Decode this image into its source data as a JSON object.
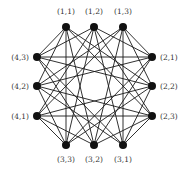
{
  "diagram": {
    "title": "",
    "type": "graph",
    "colors": {
      "node": "#111111",
      "edge": "#1a1a1a",
      "label": "#333333",
      "background": "#ffffff"
    },
    "nodes": [
      {
        "id": "1,1",
        "label": "(1,1)",
        "x": 66,
        "y": 27,
        "lx": 66,
        "ly": 14,
        "anchor": "middle"
      },
      {
        "id": "1,2",
        "label": "(1,2)",
        "x": 94,
        "y": 27,
        "lx": 94,
        "ly": 14,
        "anchor": "middle"
      },
      {
        "id": "1,3",
        "label": "(1,3)",
        "x": 123,
        "y": 27,
        "lx": 123,
        "ly": 14,
        "anchor": "middle"
      },
      {
        "id": "2,1",
        "label": "(2,1)",
        "x": 152,
        "y": 57,
        "lx": 160,
        "ly": 60,
        "anchor": "start"
      },
      {
        "id": "2,2",
        "label": "(2,2)",
        "x": 152,
        "y": 86,
        "lx": 160,
        "ly": 89,
        "anchor": "start"
      },
      {
        "id": "2,3",
        "label": "(2,3)",
        "x": 152,
        "y": 116,
        "lx": 160,
        "ly": 119,
        "anchor": "start"
      },
      {
        "id": "3,1",
        "label": "(3,1)",
        "x": 123,
        "y": 145,
        "lx": 123,
        "ly": 162,
        "anchor": "middle"
      },
      {
        "id": "3,2",
        "label": "(3,2)",
        "x": 94,
        "y": 145,
        "lx": 94,
        "ly": 162,
        "anchor": "middle"
      },
      {
        "id": "3,3",
        "label": "(3,3)",
        "x": 66,
        "y": 145,
        "lx": 66,
        "ly": 162,
        "anchor": "middle"
      },
      {
        "id": "4,1",
        "label": "(4,1)",
        "x": 37,
        "y": 116,
        "lx": 29,
        "ly": 119,
        "anchor": "end"
      },
      {
        "id": "4,2",
        "label": "(4,2)",
        "x": 37,
        "y": 86,
        "lx": 29,
        "ly": 89,
        "anchor": "end"
      },
      {
        "id": "4,3",
        "label": "(4,3)",
        "x": 37,
        "y": 57,
        "lx": 29,
        "ly": 60,
        "anchor": "end"
      }
    ],
    "edge_rule": "i != k && j != l"
  }
}
